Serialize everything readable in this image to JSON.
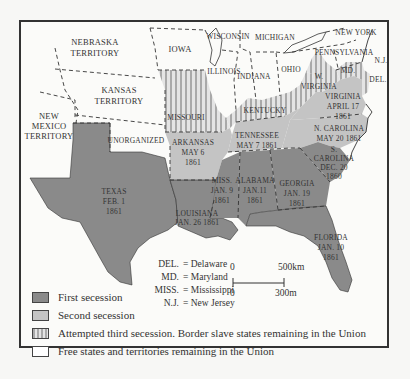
{
  "map": {
    "title": "Secession of Southern States, 1860–1861",
    "regions": [
      {
        "name": "NEBRASKA\nTERRITORY",
        "category": "free"
      },
      {
        "name": "IOWA",
        "category": "free"
      },
      {
        "name": "WISCONSIN",
        "category": "free"
      },
      {
        "name": "MICHIGAN",
        "category": "free"
      },
      {
        "name": "NEW YORK",
        "category": "free"
      },
      {
        "name": "PENNSYLVANIA",
        "category": "free"
      },
      {
        "name": "N.J.",
        "category": "free"
      },
      {
        "name": "ILLINOIS",
        "category": "free"
      },
      {
        "name": "INDIANA",
        "category": "free"
      },
      {
        "name": "OHIO",
        "category": "free"
      },
      {
        "name": "KANSAS\nTERRITORY",
        "category": "free"
      },
      {
        "name": "NEW\nMEXICO\nTERRITORY",
        "category": "free"
      },
      {
        "name": "UNORGANIZED",
        "category": "free"
      },
      {
        "name": "MISSOURI",
        "category": "third"
      },
      {
        "name": "KENTUCKY",
        "category": "third"
      },
      {
        "name": "W.\nVIRGINIA",
        "category": "third"
      },
      {
        "name": "MD.",
        "category": "third"
      },
      {
        "name": "DEL.",
        "category": "third"
      },
      {
        "name": "ARKANSAS",
        "date": "MAY 6\n1861",
        "category": "second"
      },
      {
        "name": "TENNESSEE",
        "date": "MAY 7 1861",
        "category": "second"
      },
      {
        "name": "VIRGINIA",
        "date": "APRIL 17\n1861",
        "category": "second"
      },
      {
        "name": "N. CAROLINA",
        "date": "MAY 20 1861",
        "category": "second"
      },
      {
        "name": "S.\nCAROLINA",
        "date": "DEC. 20\n1860",
        "category": "first"
      },
      {
        "name": "GEORGIA",
        "date": "JAN. 19\n1861",
        "category": "first"
      },
      {
        "name": "ALABAMA",
        "date": "JAN.11\n1861",
        "category": "first"
      },
      {
        "name": "MISS.",
        "date": "JAN. 9\n1861",
        "category": "first"
      },
      {
        "name": "LOUISIANA",
        "date": "JAN. 26 1861",
        "category": "first"
      },
      {
        "name": "FLORIDA",
        "date": "JAN. 10\n1861",
        "category": "first"
      },
      {
        "name": "TEXAS",
        "date": "FEB. 1\n1861",
        "category": "first"
      }
    ],
    "labels": {
      "nebraska": [
        "NEBRASKA",
        "TERRITORY"
      ],
      "iowa": "IOWA",
      "wisconsin": "WISCONSIN",
      "michigan": "MICHIGAN",
      "newyork": "NEW YORK",
      "pennsylvania": "PENNSYLVANIA",
      "nj": "N.J.",
      "illinois": "ILLINOIS",
      "indiana": "INDIANA",
      "ohio": "OHIO",
      "kansas": [
        "KANSAS",
        "TERRITORY"
      ],
      "newmexico": [
        "NEW",
        "MEXICO",
        "TERRITORY"
      ],
      "unorganized": "UNORGANIZED",
      "missouri": "MISSOURI",
      "kentucky": "KENTUCKY",
      "wvirginia": [
        "W.",
        "VIRGINIA"
      ],
      "md": "MD.",
      "del": "DEL.",
      "arkansas": [
        "ARKANSAS",
        "MAY 6",
        "1861"
      ],
      "tennessee": [
        "TENNESSEE",
        "MAY 7 1861"
      ],
      "virginia": [
        "VIRGINIA",
        "APRIL 17",
        "1861"
      ],
      "ncarolina": [
        "N. CAROLINA",
        "MAY 20 1861"
      ],
      "scarolina": [
        "S.",
        "CAROLINA",
        "DEC. 20",
        "1860"
      ],
      "georgia": [
        "GEORGIA",
        "JAN. 19",
        "1861"
      ],
      "alabama": [
        "ALABAMA",
        "JAN.11",
        "1861"
      ],
      "miss": [
        "MISS.",
        "JAN. 9",
        "1861"
      ],
      "louisiana": [
        "LOUISIANA",
        "JAN. 26 1861"
      ],
      "florida": [
        "FLORIDA",
        "JAN. 10",
        "1861"
      ],
      "texas": [
        "TEXAS",
        "FEB. 1",
        "1861"
      ]
    },
    "abbreviations": [
      {
        "key": "DEL.",
        "value": "= Delaware"
      },
      {
        "key": "MD.",
        "value": "= Maryland"
      },
      {
        "key": "MISS.",
        "value": "= Mississippi"
      },
      {
        "key": "N.J.",
        "value": "= New Jersey"
      }
    ],
    "scale": {
      "km_start": "0",
      "km_end": "500km",
      "mi_start": "0",
      "mi_end": "300m"
    },
    "legend": [
      {
        "label": "First secession",
        "color": "#8a8a8a",
        "pattern": "solid"
      },
      {
        "label": "Second secession",
        "color": "#c4c4c4",
        "pattern": "solid"
      },
      {
        "label": "Attempted third secession. Border slave states remaining in the Union",
        "color": "#d6d6d6",
        "pattern": "stripes"
      },
      {
        "label": "Free states and territories remaining in the Union",
        "color": "#ffffff",
        "pattern": "none"
      }
    ],
    "colors": {
      "first": "#8a8a8a",
      "second": "#c4c4c4",
      "third_bg": "#e2e2e2",
      "third_stripe": "#a8a8a8",
      "free": "#fbfbf9",
      "border": "#333333"
    }
  }
}
